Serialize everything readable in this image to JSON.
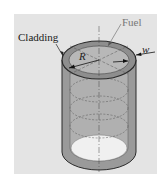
{
  "diagram": {
    "type": "fuel-rod-cross-section",
    "labels": {
      "cladding": "Cladding",
      "fuel": "Fuel",
      "radius": "R",
      "width": "w"
    },
    "colors": {
      "background": "#ffffff",
      "panel": "#e4e4e4",
      "cladding_fill": "#9a9a9a",
      "fuel_fill": "#b8b8b8",
      "bottom_inner": "#f2f2f2",
      "outline": "#2a2a2a"
    }
  }
}
